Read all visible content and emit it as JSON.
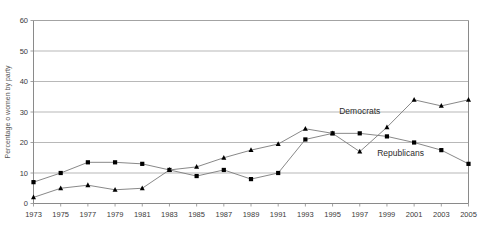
{
  "chart_data": {
    "type": "line",
    "title": "",
    "subtitle": "",
    "xlabel": "",
    "ylabel": "Percentage o women by party",
    "ylim": [
      0,
      60
    ],
    "ytick_values": [
      0,
      10,
      20,
      30,
      40,
      50,
      60
    ],
    "ytick_labels": [
      "0",
      "10",
      "20",
      "30",
      "40",
      "50",
      "60"
    ],
    "grid": true,
    "grid_axis": "y",
    "legend_position": "inline-annotation",
    "categories": [
      "1973",
      "1975",
      "1977",
      "1979",
      "1981",
      "1983",
      "1985",
      "1987",
      "1989",
      "1991",
      "1993",
      "1995",
      "1997",
      "1999",
      "2001",
      "2003",
      "2005"
    ],
    "x": [
      1973,
      1975,
      1977,
      1979,
      1981,
      1983,
      1985,
      1987,
      1989,
      1991,
      1993,
      1995,
      1997,
      1999,
      2001,
      2003,
      2005
    ],
    "series": [
      {
        "name": "Republicans",
        "marker": "square",
        "color": "#000000",
        "line_color": "#7a7a7a",
        "values": [
          7,
          10,
          13.5,
          13.5,
          13,
          11,
          9,
          11,
          8,
          10,
          21,
          23,
          23,
          22,
          20,
          17.5,
          13
        ]
      },
      {
        "name": "Democrats",
        "marker": "triangle",
        "color": "#000000",
        "line_color": "#7a7a7a",
        "values": [
          2,
          5,
          6,
          4.5,
          5,
          11,
          12,
          15,
          17.5,
          19.5,
          24.5,
          23,
          17,
          25,
          34,
          32,
          34
        ]
      }
    ],
    "annotations": [
      {
        "text": "Democrats",
        "x": 1997,
        "y": 29.5,
        "series": "Democrats"
      },
      {
        "text": "Republicans",
        "x": 2000,
        "y": 15.5,
        "series": "Republicans"
      }
    ]
  }
}
